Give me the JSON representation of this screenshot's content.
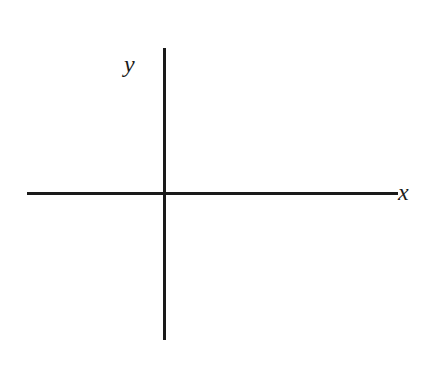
{
  "diagram": {
    "type": "cartesian-axes",
    "axes": {
      "x": {
        "label": "x"
      },
      "y": {
        "label": "y"
      }
    },
    "colors": {
      "background": "#ffffff",
      "axis": "#1a1a1a"
    }
  }
}
